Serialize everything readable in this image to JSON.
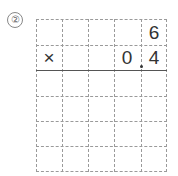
{
  "problem": {
    "number_label": "②",
    "rows": [
      [
        "",
        "",
        "",
        "",
        "6"
      ],
      [
        "×",
        "",
        "",
        "0",
        "4"
      ],
      [
        "",
        "",
        "",
        "",
        ""
      ],
      [
        "",
        "",
        "",
        "",
        ""
      ],
      [
        "",
        "",
        "",
        "",
        ""
      ],
      [
        "",
        "",
        "",
        "",
        ""
      ]
    ],
    "operator": "×",
    "multiplicand": "6",
    "multiplier": "0.4",
    "decimal_point_after_column": 3
  }
}
